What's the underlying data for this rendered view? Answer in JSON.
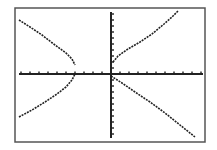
{
  "chart_data": {
    "type": "line",
    "title": "",
    "xlabel": "",
    "ylabel": "",
    "window": {
      "xmin": -10,
      "xmax": 10,
      "ymin": -10,
      "ymax": 10,
      "xscl": 1,
      "yscl": 1
    },
    "grid": false,
    "legend": "none",
    "series": [
      {
        "name": "upper-left branch",
        "points": [
          [
            -10,
            8.4
          ],
          [
            -8,
            7.0
          ],
          [
            -6,
            5.4
          ],
          [
            -4.5,
            4.0
          ],
          [
            -4,
            1.2
          ]
        ]
      },
      {
        "name": "lower-left branch",
        "points": [
          [
            -10,
            -6.8
          ],
          [
            -8,
            -5.4
          ],
          [
            -6,
            -3.9
          ],
          [
            -4.5,
            -2.0
          ],
          [
            -4,
            0
          ]
        ]
      },
      {
        "name": "upper-right branch",
        "points": [
          [
            0.2,
            1.8
          ],
          [
            2,
            3.8
          ],
          [
            4,
            5.4
          ],
          [
            6,
            7.2
          ],
          [
            7.2,
            10
          ]
        ]
      },
      {
        "name": "lower-right branch",
        "points": [
          [
            0,
            -0.3
          ],
          [
            2,
            -2.3
          ],
          [
            4,
            -4.0
          ],
          [
            6,
            -5.8
          ],
          [
            8,
            -7.6
          ],
          [
            9.2,
            -10
          ]
        ]
      }
    ]
  },
  "screen": {
    "border_color": "#555555",
    "ink_color": "#222222",
    "background": "#ffffff"
  },
  "pixel_layout": {
    "frame": {
      "x": 15,
      "y": 8,
      "w": 190,
      "h": 134
    },
    "x_axis_y": 74,
    "y_axis_x": 111,
    "x_axis_range": [
      19,
      203
    ],
    "y_axis_range": [
      12,
      138
    ],
    "x_ticks_left": [
      102,
      93,
      84,
      75,
      66,
      57,
      48,
      39,
      30,
      21
    ],
    "x_ticks_right": [
      120,
      129,
      138,
      147,
      156,
      165,
      174,
      183,
      192,
      201
    ],
    "y_ticks_up": [
      68,
      62,
      56,
      50,
      44,
      38,
      32,
      26,
      20,
      14
    ],
    "y_ticks_down": [
      80,
      86,
      92,
      98,
      104,
      110,
      116,
      122,
      128,
      134
    ],
    "curves": [
      {
        "name": "upper-left",
        "d": "M19,20 L30,27 L42,35 L55,45 L66,53 L72,59 L75,65"
      },
      {
        "name": "lower-left",
        "d": "M19,117 L32,110 L45,102 L57,94 L66,87 L72,80 L75,74"
      },
      {
        "name": "upper-right",
        "d": "M113,62 L118,56 L128,49 L140,42 L152,34 L164,24 L172,17 L178,11"
      },
      {
        "name": "lower-right",
        "d": "M111,76 L122,83 L135,92 L150,102 L165,113 L180,125 L195,137"
      }
    ]
  }
}
